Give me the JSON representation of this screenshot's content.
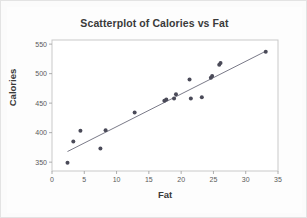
{
  "figure": {
    "title": "Scatterplot of Calories vs Fat",
    "background_color": "#fbfbfb",
    "plot_background_color": "#ffffff",
    "frame_color": "#c9c9c9"
  },
  "chart_data": {
    "type": "scatter",
    "title": "Scatterplot of Calories vs Fat",
    "xlabel": "Fat",
    "ylabel": "Calories",
    "xlim": [
      0,
      35
    ],
    "ylim": [
      335,
      557
    ],
    "xticks": [
      0,
      5,
      10,
      15,
      20,
      25,
      30,
      35
    ],
    "yticks": [
      350,
      400,
      450,
      500,
      550
    ],
    "xtick_labels": [
      "0",
      "5",
      "10",
      "15",
      "20",
      "25",
      "30",
      "35"
    ],
    "ytick_labels": [
      "350",
      "400",
      "450",
      "500",
      "550"
    ],
    "grid": false,
    "legend": null,
    "marker_color": "#4a4a58",
    "marker_size": 2.0,
    "points": [
      {
        "x": 2.4,
        "y": 349
      },
      {
        "x": 3.3,
        "y": 385
      },
      {
        "x": 4.4,
        "y": 403
      },
      {
        "x": 7.5,
        "y": 373
      },
      {
        "x": 8.3,
        "y": 404
      },
      {
        "x": 12.8,
        "y": 434
      },
      {
        "x": 17.4,
        "y": 454
      },
      {
        "x": 17.7,
        "y": 456
      },
      {
        "x": 18.9,
        "y": 458
      },
      {
        "x": 19.2,
        "y": 465
      },
      {
        "x": 21.3,
        "y": 490
      },
      {
        "x": 21.5,
        "y": 458
      },
      {
        "x": 23.2,
        "y": 460
      },
      {
        "x": 24.6,
        "y": 493
      },
      {
        "x": 24.8,
        "y": 496
      },
      {
        "x": 25.9,
        "y": 515
      },
      {
        "x": 26.1,
        "y": 518
      },
      {
        "x": 33.1,
        "y": 537
      }
    ],
    "fit_line": {
      "name": "regression-line",
      "color": "#6b6b7a",
      "x_start": 2.4,
      "y_start": 368,
      "x_end": 33.1,
      "y_end": 538
    }
  }
}
